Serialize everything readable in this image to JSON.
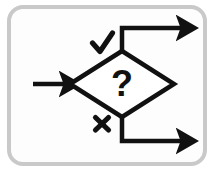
{
  "figure": {
    "type": "flowchart",
    "background_color": "#ffffff",
    "frame": {
      "name": "rounded-frame",
      "stroke_color": "#c9c9c9",
      "fill_color": "#fdfdfd",
      "stroke_width": 4,
      "corner_radius": 14,
      "x": 9,
      "y": 7,
      "width": 196,
      "height": 157
    },
    "ink_color": "#111111",
    "line_width": 4.5
  },
  "nodes": {
    "decision": {
      "name": "decision-diamond",
      "label": "?",
      "center_x": 122,
      "center_y": 84,
      "half_width": 52,
      "half_height": 33,
      "label_font_size": 34
    }
  },
  "edges": [
    {
      "name": "input-arrow",
      "label": "",
      "from": [
        33,
        84
      ],
      "to": [
        68,
        84
      ],
      "direction": "right"
    },
    {
      "name": "yes-branch-arrow",
      "label": "✓",
      "marker": "check",
      "marker_x": 102,
      "marker_y": 44,
      "path": "M 122 51 L 122 28 L 185 28",
      "direction": "right"
    },
    {
      "name": "no-branch-arrow",
      "label": "✗",
      "marker": "cross",
      "marker_x": 102,
      "marker_y": 124,
      "path": "M 122 117 L 122 141 L 185 141",
      "direction": "right"
    }
  ],
  "labels": {
    "question_mark": "?",
    "check_mark": "check-mark",
    "cross_mark": "cross-mark"
  }
}
